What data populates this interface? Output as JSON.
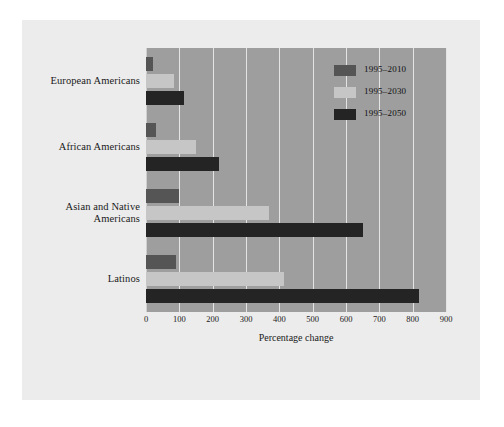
{
  "figure": {
    "axis_title": "Percentage change",
    "panel_color": "#ececec",
    "plot_background": "#9e9e9e",
    "gridline_color": "#e4e4e4"
  },
  "legend": {
    "items": [
      {
        "label": "1995–2010",
        "color": "#555555",
        "key": "s2010"
      },
      {
        "label": "1995–2030",
        "color": "#c6c6c6",
        "key": "s2030"
      },
      {
        "label": "1995–2050",
        "color": "#242424",
        "key": "s2050"
      }
    ]
  },
  "categories": [
    {
      "line1": "European Americans",
      "line2": ""
    },
    {
      "line1": "African Americans",
      "line2": ""
    },
    {
      "line1": "Asian and Native",
      "line2": "Americans"
    },
    {
      "line1": "Latinos",
      "line2": ""
    }
  ],
  "ticks": [
    "0",
    "100",
    "200",
    "300",
    "400",
    "500",
    "600",
    "700",
    "800",
    "900"
  ],
  "chart_data": {
    "type": "bar",
    "orientation": "horizontal",
    "title": "",
    "subtitle": "",
    "xlabel": "Percentage change",
    "ylabel": "",
    "xlim": [
      0,
      900
    ],
    "xticks": [
      0,
      100,
      200,
      300,
      400,
      500,
      600,
      700,
      800,
      900
    ],
    "grid": true,
    "legend_position": "top-right",
    "categories": [
      "European Americans",
      "African Americans",
      "Asian and Native Americans",
      "Latinos"
    ],
    "series": [
      {
        "name": "1995–2010",
        "color": "#555555",
        "values": [
          20,
          30,
          100,
          90
        ]
      },
      {
        "name": "1995–2030",
        "color": "#c6c6c6",
        "values": [
          85,
          150,
          370,
          415
        ]
      },
      {
        "name": "1995–2050",
        "color": "#242424",
        "values": [
          115,
          220,
          650,
          820
        ]
      }
    ]
  }
}
